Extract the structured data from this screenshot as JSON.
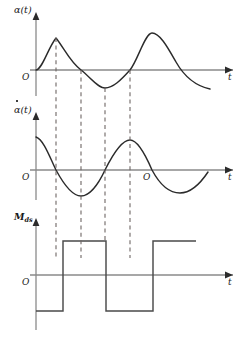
{
  "figure": {
    "type": "technical-waveform-diagram",
    "width": 242,
    "height": 348,
    "colors": {
      "curve": "#2b2b2b",
      "axis": "#8a8a8a",
      "dashed": "#6e6664",
      "background": "#ffffff",
      "text": "#1a1a1a"
    }
  },
  "panels": [
    {
      "id": "panel-alpha",
      "y_label": "α(t)",
      "y_label_has_dot": false,
      "x_label": "t",
      "origin_label": "O",
      "axis_y": 70,
      "axis_x_start": 30,
      "axis_x_end": 233,
      "y_axis_top": 12,
      "y_axis_bottom": 96,
      "curve_type": "sinusoid",
      "amplitude": 32,
      "wavelength": 99,
      "phase": "starts at origin rising",
      "extrema": [
        {
          "kind": "peak",
          "x": 56,
          "y": 38
        },
        {
          "kind": "zero",
          "x": 81,
          "y": 70
        },
        {
          "kind": "trough",
          "x": 105,
          "y": 88
        },
        {
          "kind": "zero",
          "x": 130,
          "y": 70
        },
        {
          "kind": "peak",
          "x": 152,
          "y": 33
        }
      ]
    },
    {
      "id": "panel-alpha-dot",
      "y_label": "α(t)",
      "y_label_has_dot": true,
      "x_label": "t",
      "origin_label": "O",
      "second_origin_label": "O",
      "second_origin_x": 147,
      "axis_y": 170,
      "axis_x_start": 30,
      "axis_x_end": 233,
      "y_axis_top": 112,
      "y_axis_bottom": 200,
      "curve_type": "sinusoid-derivative",
      "amplitude": 26,
      "extrema": [
        {
          "kind": "start-high",
          "x": 36,
          "y": 137
        },
        {
          "kind": "zero",
          "x": 56,
          "y": 170
        },
        {
          "kind": "trough",
          "x": 81,
          "y": 196
        },
        {
          "kind": "zero",
          "x": 105,
          "y": 170
        },
        {
          "kind": "peak",
          "x": 130,
          "y": 140
        },
        {
          "kind": "zero",
          "x": 152,
          "y": 170
        },
        {
          "kind": "trough",
          "x": 180,
          "y": 193
        }
      ]
    },
    {
      "id": "panel-moment",
      "y_label": "M",
      "y_label_subscript": "ds",
      "y_label_has_dot": false,
      "x_label": "t",
      "origin_label": "O",
      "axis_y": 275,
      "axis_x_start": 30,
      "axis_x_end": 233,
      "y_axis_top": 218,
      "y_axis_bottom": 330,
      "curve_type": "square-wave-bipolar",
      "high_level_y": 241,
      "low_level_y": 311,
      "segments": [
        {
          "level": "low",
          "x_start": 36,
          "x_end": 63
        },
        {
          "level": "high",
          "x_start": 63,
          "x_end": 106
        },
        {
          "level": "low",
          "x_start": 106,
          "x_end": 153
        },
        {
          "level": "high",
          "x_start": 153,
          "x_end": 196
        }
      ],
      "transitions": [
        63,
        106,
        153
      ]
    }
  ],
  "dashed_lines": [
    {
      "id": "dash-1",
      "x": 56,
      "y_top": 38,
      "y_bottom": 258,
      "aligns": "alpha peak / alpha-dot zero / moment rise"
    },
    {
      "id": "dash-2",
      "x": 81,
      "y_top": 70,
      "y_bottom": 258,
      "aligns": "alpha zero / alpha-dot trough"
    },
    {
      "id": "dash-3",
      "x": 105,
      "y_top": 88,
      "y_bottom": 241,
      "aligns": "alpha trough / alpha-dot zero / moment fall"
    },
    {
      "id": "dash-4",
      "x": 130,
      "y_top": 70,
      "y_bottom": 258,
      "aligns": "alpha zero / alpha-dot peak"
    }
  ]
}
